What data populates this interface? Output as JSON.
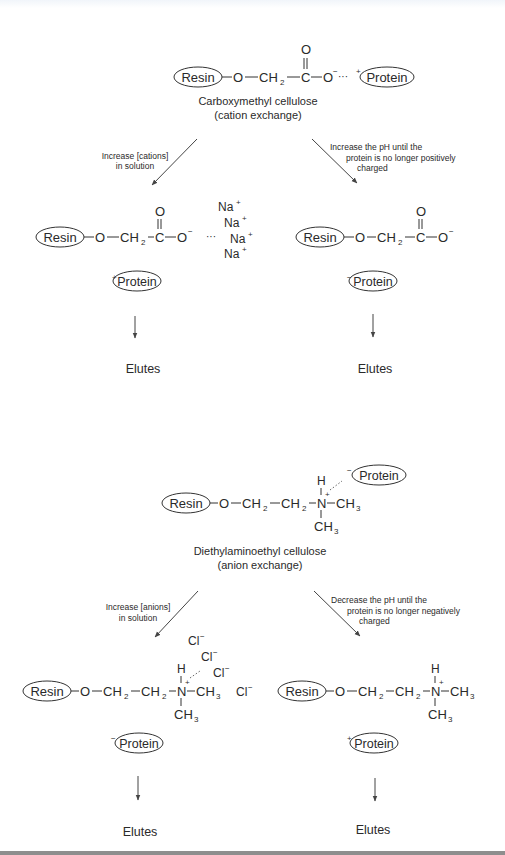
{
  "figure": {
    "top": {
      "label": "Carboxymethyl cellulose",
      "sublabel": "(cation exchange)",
      "resin": "Resin",
      "protein": "Protein",
      "protein_charge": "+",
      "atoms": {
        "o1": "O",
        "ch2": "CH",
        "sub2": "2",
        "c": "C",
        "o_top": "O",
        "o2": "O",
        "minus": "−",
        "dots": "···"
      },
      "left_branch": {
        "line1": "Increase [cations]",
        "line2": "in solution",
        "ions": [
          "Na",
          "Na",
          "Na",
          "Na"
        ],
        "ion_charge": "+",
        "protein_charge": "+",
        "result": "Elutes"
      },
      "right_branch": {
        "line1": "Increase the pH until the",
        "line2": "protein is no longer positively",
        "line3": "charged",
        "protein_charge": "−",
        "result": "Elutes"
      }
    },
    "bottom": {
      "label": "Diethylaminoethyl cellulose",
      "sublabel": "(anion exchange)",
      "resin": "Resin",
      "protein": "Protein",
      "protein_charge": "−",
      "atoms": {
        "o1": "O",
        "ch2": "CH",
        "sub2": "2",
        "n": "N",
        "h": "H",
        "ch3": "CH",
        "sub3": "3",
        "plus": "+"
      },
      "left_branch": {
        "line1": "Increase [anions]",
        "line2": "in solution",
        "ions": [
          "Cl",
          "Cl",
          "Cl",
          "Cl"
        ],
        "ion_charge": "−",
        "protein_charge": "−",
        "result": "Elutes"
      },
      "right_branch": {
        "line1": "Decrease the pH until the",
        "line2": "protein is no longer negatively",
        "line3": "charged",
        "protein_charge": "+",
        "result": "Elutes"
      }
    }
  }
}
